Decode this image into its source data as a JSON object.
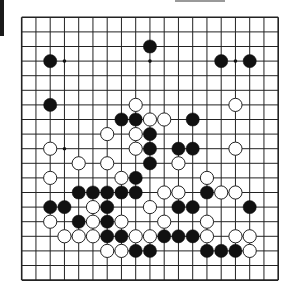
{
  "board": {
    "size": 19,
    "origin_x": 21.7,
    "origin_y": 17.3,
    "spacing_x": 14.25,
    "spacing_y": 14.6,
    "stone_radius": 6.6,
    "colors": {
      "background": "#ffffff",
      "grid_line": "#222222",
      "black_stone": "#111111",
      "white_stone_fill": "#ffffff",
      "white_stone_stroke": "#222222"
    },
    "markers": [
      {
        "row": 3,
        "col": 3
      },
      {
        "row": 3,
        "col": 9
      },
      {
        "row": 3,
        "col": 15
      },
      {
        "row": 9,
        "col": 3
      }
    ],
    "stones": [
      {
        "row": 2,
        "col": 9,
        "color": "black"
      },
      {
        "row": 3,
        "col": 2,
        "color": "black"
      },
      {
        "row": 3,
        "col": 14,
        "color": "black"
      },
      {
        "row": 3,
        "col": 16,
        "color": "black"
      },
      {
        "row": 6,
        "col": 2,
        "color": "black"
      },
      {
        "row": 6,
        "col": 8,
        "color": "white"
      },
      {
        "row": 6,
        "col": 15,
        "color": "white"
      },
      {
        "row": 7,
        "col": 7,
        "color": "black"
      },
      {
        "row": 7,
        "col": 8,
        "color": "black"
      },
      {
        "row": 7,
        "col": 9,
        "color": "white"
      },
      {
        "row": 7,
        "col": 10,
        "color": "white"
      },
      {
        "row": 7,
        "col": 12,
        "color": "black"
      },
      {
        "row": 8,
        "col": 6,
        "color": "white"
      },
      {
        "row": 8,
        "col": 8,
        "color": "white"
      },
      {
        "row": 8,
        "col": 9,
        "color": "black"
      },
      {
        "row": 9,
        "col": 2,
        "color": "white"
      },
      {
        "row": 9,
        "col": 8,
        "color": "white"
      },
      {
        "row": 9,
        "col": 9,
        "color": "black"
      },
      {
        "row": 9,
        "col": 11,
        "color": "black"
      },
      {
        "row": 9,
        "col": 12,
        "color": "black"
      },
      {
        "row": 9,
        "col": 15,
        "color": "white"
      },
      {
        "row": 10,
        "col": 4,
        "color": "white"
      },
      {
        "row": 10,
        "col": 6,
        "color": "white"
      },
      {
        "row": 10,
        "col": 9,
        "color": "black"
      },
      {
        "row": 10,
        "col": 11,
        "color": "white"
      },
      {
        "row": 11,
        "col": 2,
        "color": "white"
      },
      {
        "row": 11,
        "col": 7,
        "color": "white"
      },
      {
        "row": 11,
        "col": 8,
        "color": "black"
      },
      {
        "row": 11,
        "col": 13,
        "color": "white"
      },
      {
        "row": 12,
        "col": 4,
        "color": "black"
      },
      {
        "row": 12,
        "col": 5,
        "color": "black"
      },
      {
        "row": 12,
        "col": 6,
        "color": "black"
      },
      {
        "row": 12,
        "col": 7,
        "color": "black"
      },
      {
        "row": 12,
        "col": 8,
        "color": "black"
      },
      {
        "row": 12,
        "col": 10,
        "color": "white"
      },
      {
        "row": 12,
        "col": 11,
        "color": "white"
      },
      {
        "row": 12,
        "col": 13,
        "color": "black"
      },
      {
        "row": 12,
        "col": 14,
        "color": "white"
      },
      {
        "row": 12,
        "col": 15,
        "color": "white"
      },
      {
        "row": 13,
        "col": 2,
        "color": "black"
      },
      {
        "row": 13,
        "col": 3,
        "color": "black"
      },
      {
        "row": 13,
        "col": 5,
        "color": "white"
      },
      {
        "row": 13,
        "col": 6,
        "color": "black"
      },
      {
        "row": 13,
        "col": 9,
        "color": "white"
      },
      {
        "row": 13,
        "col": 11,
        "color": "black"
      },
      {
        "row": 13,
        "col": 12,
        "color": "black"
      },
      {
        "row": 13,
        "col": 16,
        "color": "black"
      },
      {
        "row": 14,
        "col": 2,
        "color": "white"
      },
      {
        "row": 14,
        "col": 4,
        "color": "black"
      },
      {
        "row": 14,
        "col": 5,
        "color": "white"
      },
      {
        "row": 14,
        "col": 6,
        "color": "black"
      },
      {
        "row": 14,
        "col": 7,
        "color": "white"
      },
      {
        "row": 14,
        "col": 10,
        "color": "white"
      },
      {
        "row": 14,
        "col": 13,
        "color": "white"
      },
      {
        "row": 15,
        "col": 3,
        "color": "white"
      },
      {
        "row": 15,
        "col": 4,
        "color": "white"
      },
      {
        "row": 15,
        "col": 5,
        "color": "white"
      },
      {
        "row": 15,
        "col": 6,
        "color": "black"
      },
      {
        "row": 15,
        "col": 7,
        "color": "black"
      },
      {
        "row": 15,
        "col": 8,
        "color": "white"
      },
      {
        "row": 15,
        "col": 9,
        "color": "white"
      },
      {
        "row": 15,
        "col": 10,
        "color": "black"
      },
      {
        "row": 15,
        "col": 11,
        "color": "black"
      },
      {
        "row": 15,
        "col": 12,
        "color": "black"
      },
      {
        "row": 15,
        "col": 13,
        "color": "white"
      },
      {
        "row": 15,
        "col": 15,
        "color": "white"
      },
      {
        "row": 15,
        "col": 16,
        "color": "white"
      },
      {
        "row": 16,
        "col": 6,
        "color": "white"
      },
      {
        "row": 16,
        "col": 7,
        "color": "white"
      },
      {
        "row": 16,
        "col": 8,
        "color": "black"
      },
      {
        "row": 16,
        "col": 9,
        "color": "black"
      },
      {
        "row": 16,
        "col": 13,
        "color": "black"
      },
      {
        "row": 16,
        "col": 14,
        "color": "black"
      },
      {
        "row": 16,
        "col": 15,
        "color": "black"
      },
      {
        "row": 16,
        "col": 16,
        "color": "white"
      }
    ]
  }
}
